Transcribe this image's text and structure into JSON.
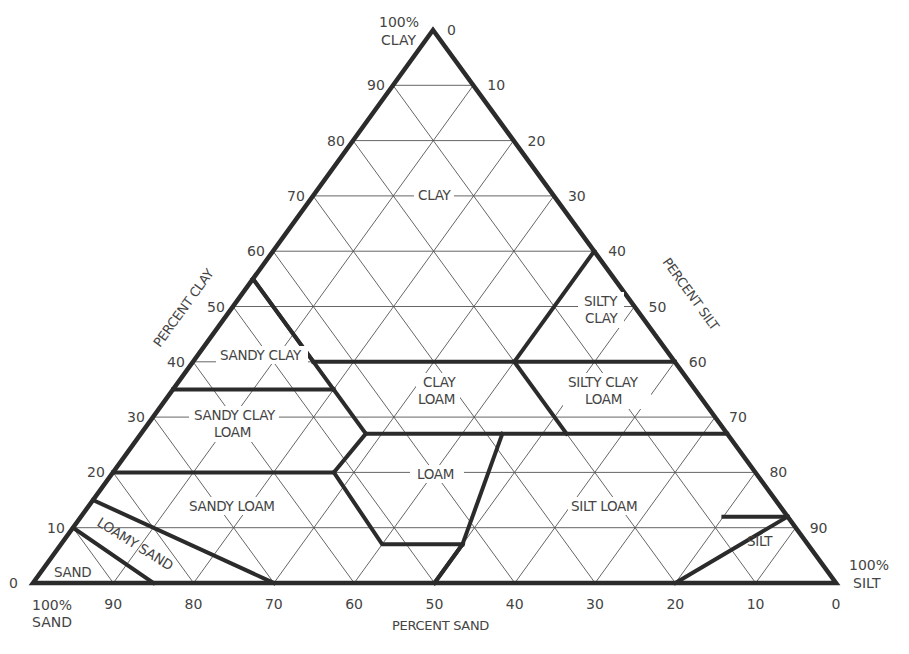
{
  "chart_data": {
    "type": "ternary",
    "title": "",
    "axes": {
      "clay": {
        "label": "PERCENT CLAY",
        "apex_label": [
          "100%",
          "CLAY"
        ],
        "ticks": [
          0,
          10,
          20,
          30,
          40,
          50,
          60,
          70,
          80,
          90
        ]
      },
      "silt": {
        "label": "PERCENT SILT",
        "apex_label": [
          "100%",
          "SILT"
        ],
        "ticks": [
          0,
          10,
          20,
          30,
          40,
          50,
          60,
          70,
          80,
          90
        ]
      },
      "sand": {
        "label": "PERCENT SAND",
        "apex_label": [
          "100%",
          "SAND"
        ],
        "ticks": [
          90,
          80,
          70,
          60,
          50,
          40,
          30,
          20,
          10,
          0
        ]
      }
    },
    "grid": true,
    "grid_step": 10,
    "regions": [
      {
        "name": "CLAY",
        "lines": [
          "CLAY"
        ]
      },
      {
        "name": "SILTY CLAY",
        "lines": [
          "SILTY",
          "CLAY"
        ]
      },
      {
        "name": "SANDY CLAY",
        "lines": [
          "SANDY CLAY"
        ]
      },
      {
        "name": "CLAY LOAM",
        "lines": [
          "CLAY",
          "LOAM"
        ]
      },
      {
        "name": "SILTY CLAY LOAM",
        "lines": [
          "SILTY CLAY",
          "LOAM"
        ]
      },
      {
        "name": "SANDY CLAY LOAM",
        "lines": [
          "SANDY CLAY",
          "LOAM"
        ]
      },
      {
        "name": "LOAM",
        "lines": [
          "LOAM"
        ]
      },
      {
        "name": "SILT LOAM",
        "lines": [
          "SILT LOAM"
        ]
      },
      {
        "name": "SANDY LOAM",
        "lines": [
          "SANDY LOAM"
        ]
      },
      {
        "name": "LOAMY SAND",
        "lines": [
          "LOAMY SAND"
        ]
      },
      {
        "name": "SAND",
        "lines": [
          "SAND"
        ]
      },
      {
        "name": "SILT",
        "lines": [
          "SILT"
        ]
      }
    ],
    "boundaries": [
      [
        [
          40,
          60
        ],
        [
          40,
          45
        ],
        [
          27.5,
          32.5
        ]
      ],
      [
        [
          40,
          45
        ],
        [
          40,
          60
        ]
      ],
      [
        [
          55,
          45
        ],
        [
          35,
          45
        ],
        [
          35,
          40
        ],
        [
          45,
          37
        ],
        [
          45,
          20
        ]
      ],
      [
        [
          40,
          45
        ],
        [
          40,
          0
        ]
      ],
      [
        [
          60,
          40
        ],
        [
          60,
          27
        ]
      ],
      [
        [
          35,
          20
        ],
        [
          45,
          20
        ]
      ],
      [
        [
          27,
          27
        ],
        [
          27,
          46
        ]
      ],
      [
        [
          40,
          28
        ],
        [
          40,
          40
        ]
      ]
    ]
  },
  "labels": {
    "clay_apex_1": "100%",
    "clay_apex_2": "CLAY",
    "silt_apex_1": "100%",
    "silt_apex_2": "SILT",
    "sand_apex_1": "100%",
    "sand_apex_2": "SAND",
    "clay_axis_title": "PERCENT CLAY",
    "silt_axis_title": "PERCENT SILT",
    "sand_axis_title": "PERCENT SAND",
    "region_clay": "CLAY",
    "region_silty_clay_1": "SILTY",
    "region_silty_clay_2": "CLAY",
    "region_sandy_clay": "SANDY CLAY",
    "region_clay_loam_1": "CLAY",
    "region_clay_loam_2": "LOAM",
    "region_silty_clay_loam_1": "SILTY CLAY",
    "region_silty_clay_loam_2": "LOAM",
    "region_sandy_clay_loam_1": "SANDY CLAY",
    "region_sandy_clay_loam_2": "LOAM",
    "region_loam": "LOAM",
    "region_silt_loam": "SILT LOAM",
    "region_sandy_loam": "SANDY LOAM",
    "region_loamy_sand": "LOAMY SAND",
    "region_sand": "SAND",
    "region_silt": "SILT"
  },
  "ticks": {
    "clay": [
      "0",
      "10",
      "20",
      "30",
      "40",
      "50",
      "60",
      "70",
      "80",
      "90"
    ],
    "silt": [
      "0",
      "10",
      "20",
      "30",
      "40",
      "50",
      "60",
      "70",
      "80",
      "90"
    ],
    "sand": [
      "90",
      "80",
      "70",
      "60",
      "50",
      "40",
      "30",
      "20",
      "10",
      "0"
    ]
  }
}
